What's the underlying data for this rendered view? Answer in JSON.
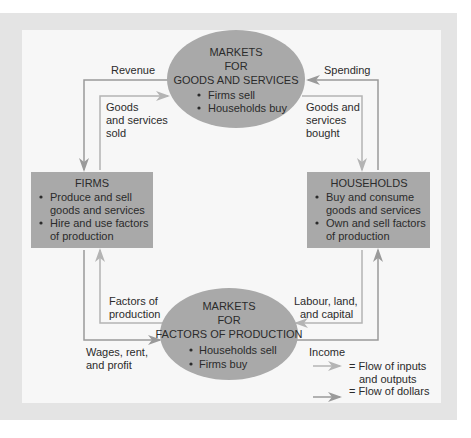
{
  "diagram": {
    "type": "circular-flow",
    "colors": {
      "panel_outer": "#e4e4e4",
      "panel_inner": "#f7f7f7",
      "node_fill": "#a9a9a9",
      "flow_goods": "#b4b4b4",
      "flow_dollars": "#9a9a9a",
      "text": "#2b2b2b"
    },
    "goods_market": {
      "title_lines": [
        "MARKETS",
        "FOR",
        "GOODS AND SERVICES"
      ],
      "bullets": [
        "Firms sell",
        "Households buy"
      ]
    },
    "factor_market": {
      "title_lines": [
        "MARKETS",
        "FOR",
        "FACTORS OF PRODUCTION"
      ],
      "bullets": [
        "Households sell",
        "Firms buy"
      ]
    },
    "firms": {
      "title": "FIRMS",
      "bullets": [
        [
          "Produce and sell",
          "goods and services"
        ],
        [
          "Hire and use factors",
          "of production"
        ]
      ]
    },
    "households": {
      "title": "HOUSEHOLDS",
      "bullets": [
        [
          "Buy and consume",
          "goods and services"
        ],
        [
          "Own and sell factors",
          "of production"
        ]
      ]
    },
    "flows": {
      "revenue": "Revenue",
      "spending": "Spending",
      "goods_sold": [
        "Goods",
        "and services",
        "sold"
      ],
      "goods_bought": [
        "Goods and",
        "services",
        "bought"
      ],
      "factors_of_production": [
        "Factors of",
        "production"
      ],
      "labour_land_capital": [
        "Labour, land,",
        "and capital"
      ],
      "wages_rent_profit": [
        "Wages, rent,",
        "and profit"
      ],
      "income": "Income"
    },
    "legend": {
      "items": [
        {
          "symbol": "light-arrow",
          "label_lines": [
            "= Flow of inputs",
            "and outputs"
          ]
        },
        {
          "symbol": "dark-arrow",
          "label_lines": [
            "= Flow of dollars"
          ]
        }
      ]
    }
  }
}
